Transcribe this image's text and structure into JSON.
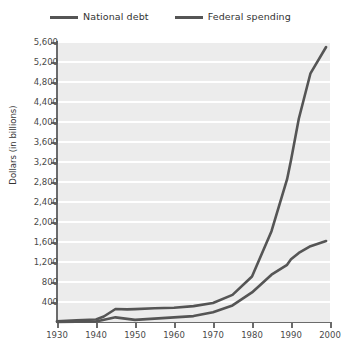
{
  "chart_data": {
    "type": "line",
    "title": "",
    "xlabel": "",
    "ylabel": "Dollars (in billions)",
    "xlim": [
      1930,
      2000
    ],
    "ylim": [
      0,
      5600
    ],
    "xticks": [
      1930,
      1940,
      1950,
      1960,
      1970,
      1980,
      1990,
      2000
    ],
    "xtick_labels": [
      "1930",
      "1940",
      "1950",
      "1960",
      "1970",
      "1980",
      "1990",
      "2000"
    ],
    "yticks": [
      400,
      800,
      1200,
      1600,
      2000,
      2400,
      2800,
      3200,
      3600,
      4000,
      4400,
      4800,
      5200,
      5600
    ],
    "ytick_labels": [
      "400",
      "800",
      "1,200",
      "1,600",
      "2,000",
      "2,400",
      "2,800",
      "3,200",
      "3,600",
      "4,000",
      "4,400",
      "4,800",
      "5,200",
      "5,600"
    ],
    "grid": true,
    "grid_axis": "y",
    "legend_position": "top-center",
    "plot_background": "#ececec",
    "gridline_color": "#ffffff",
    "line_color": "#555555",
    "series": [
      {
        "name": "National debt",
        "color": "#555555",
        "x": [
          1930,
          1935,
          1940,
          1942,
          1945,
          1948,
          1950,
          1955,
          1960,
          1965,
          1970,
          1975,
          1980,
          1985,
          1989,
          1990,
          1992,
          1995,
          1999
        ],
        "values": [
          16,
          34,
          50,
          110,
          260,
          252,
          257,
          274,
          286,
          317,
          381,
          542,
          909,
          1817,
          2857,
          3233,
          4065,
          4974,
          5500
        ]
      },
      {
        "name": "Federal spending",
        "color": "#555555",
        "x": [
          1930,
          1935,
          1940,
          1945,
          1950,
          1955,
          1960,
          1965,
          1970,
          1975,
          1980,
          1985,
          1989,
          1990,
          1992,
          1995,
          1999
        ],
        "values": [
          3,
          6,
          9,
          93,
          43,
          68,
          92,
          118,
          196,
          332,
          591,
          946,
          1144,
          1253,
          1382,
          1516,
          1620
        ]
      }
    ]
  },
  "legend": {
    "items": [
      {
        "label": "National debt",
        "color": "#555555"
      },
      {
        "label": "Federal spending",
        "color": "#555555"
      }
    ]
  }
}
